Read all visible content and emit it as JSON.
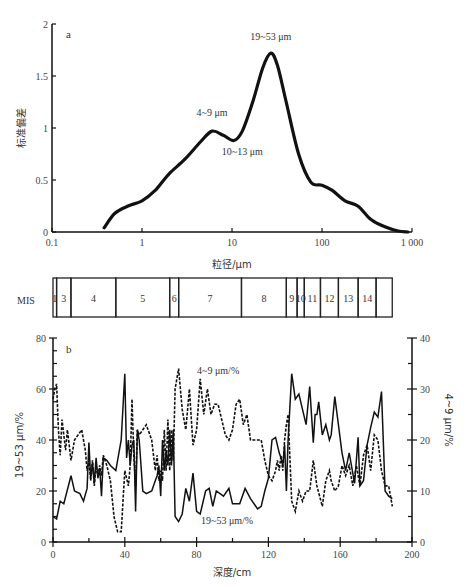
{
  "chart_data": [
    {
      "id": "a",
      "type": "line",
      "panel_label": "a",
      "title": "",
      "xlabel": "粒径/μm",
      "ylabel": "标准偏差",
      "xscale": "log",
      "xlim": [
        0.1,
        1000
      ],
      "ylim": [
        0,
        2
      ],
      "xticks": [
        "0.1",
        "1",
        "10",
        "100",
        "1 000"
      ],
      "yticks": [
        "0",
        "0.5",
        "1",
        "1.5",
        "2"
      ],
      "grid": false,
      "x": [
        0.38,
        0.5,
        0.7,
        1.0,
        1.4,
        2.0,
        3.0,
        4.5,
        6.0,
        8.0,
        10.5,
        13.0,
        17.0,
        22.0,
        27.0,
        32.0,
        40.0,
        55.0,
        75.0,
        100.0,
        130.0,
        180.0,
        250.0,
        350.0,
        500.0,
        700.0,
        900.0
      ],
      "values": [
        0.04,
        0.18,
        0.25,
        0.3,
        0.4,
        0.56,
        0.7,
        0.87,
        0.97,
        0.93,
        0.88,
        0.97,
        1.25,
        1.58,
        1.72,
        1.6,
        1.25,
        0.75,
        0.48,
        0.45,
        0.4,
        0.3,
        0.25,
        0.12,
        0.05,
        0.01,
        0.0
      ],
      "annotations": [
        {
          "text": "19~53 μm",
          "x": 27,
          "y": 1.85
        },
        {
          "text": "4~9 μm",
          "x": 6,
          "y": 1.12
        },
        {
          "text": "10~13 μm",
          "x": 13,
          "y": 0.74
        }
      ]
    },
    {
      "id": "mis",
      "type": "table",
      "label": "MIS",
      "stages": [
        {
          "label": "1",
          "from": 0,
          "to": 2
        },
        {
          "label": "3",
          "from": 2,
          "to": 10
        },
        {
          "label": "4",
          "from": 10,
          "to": 35
        },
        {
          "label": "5",
          "from": 35,
          "to": 65
        },
        {
          "label": "6",
          "from": 65,
          "to": 70
        },
        {
          "label": "7",
          "from": 70,
          "to": 105
        },
        {
          "label": "8",
          "from": 105,
          "to": 130
        },
        {
          "label": "9",
          "from": 130,
          "to": 136
        },
        {
          "label": "10",
          "from": 136,
          "to": 140
        },
        {
          "label": "11",
          "from": 140,
          "to": 149
        },
        {
          "label": "12",
          "from": 149,
          "to": 159
        },
        {
          "label": "13",
          "from": 159,
          "to": 170
        },
        {
          "label": "14",
          "from": 170,
          "to": 180
        },
        {
          "label": "",
          "from": 180,
          "to": 189
        }
      ]
    },
    {
      "id": "b",
      "type": "line",
      "panel_label": "b",
      "xlabel": "深度/cm",
      "ylabel_left": "19~53 μm/%",
      "ylabel_right": "4~9 μm/%",
      "xlim": [
        0,
        200
      ],
      "ylim_left": [
        0,
        80
      ],
      "ylim_right": [
        0,
        40
      ],
      "xticks": [
        "0",
        "40",
        "80",
        "120",
        "160",
        "200"
      ],
      "yticks_left": [
        "0",
        "20",
        "40",
        "60",
        "80"
      ],
      "yticks_right": [
        "0",
        "10",
        "20",
        "30",
        "40"
      ],
      "grid": false,
      "series": [
        {
          "name": "19~53 μm/%",
          "axis": "left",
          "style": "solid",
          "x": [
            0,
            2,
            4,
            6,
            10,
            12,
            15,
            17,
            19,
            20,
            21,
            22,
            23,
            24,
            25,
            26,
            27,
            28,
            30,
            32,
            35,
            38,
            40,
            41,
            42,
            43,
            44,
            45,
            46,
            47,
            48,
            50,
            52,
            55,
            57,
            58,
            59,
            60,
            61,
            62,
            63,
            64,
            65,
            66,
            67,
            68,
            70,
            72,
            74,
            76,
            78,
            80,
            82,
            85,
            87,
            89,
            91,
            95,
            98,
            100,
            104,
            107,
            110,
            114,
            116,
            118,
            120,
            122,
            124,
            125,
            126,
            127,
            128,
            129,
            130,
            131,
            133,
            135,
            137,
            139,
            141,
            143,
            145,
            146,
            147,
            148,
            150,
            152,
            154,
            155,
            157,
            159,
            161,
            163,
            165,
            168,
            170,
            171,
            173,
            175,
            177,
            179,
            181,
            183,
            185,
            187,
            189
          ],
          "values": [
            10,
            9,
            16,
            15,
            26,
            20,
            19,
            16,
            21,
            39,
            25,
            31,
            23,
            33,
            25,
            29,
            18,
            33,
            32,
            30,
            28,
            40,
            66,
            33,
            40,
            30,
            38,
            40,
            12,
            44,
            40,
            20,
            19,
            20,
            24,
            26,
            30,
            18,
            40,
            28,
            36,
            30,
            44,
            30,
            44,
            10,
            8,
            11,
            21,
            16,
            27,
            12,
            11,
            20,
            21,
            14,
            20,
            18,
            21,
            15,
            15,
            21,
            17,
            13,
            14,
            20,
            25,
            40,
            41,
            38,
            35,
            33,
            30,
            38,
            20,
            40,
            66,
            56,
            58,
            52,
            46,
            61,
            39,
            50,
            50,
            55,
            42,
            46,
            40,
            42,
            57,
            46,
            35,
            28,
            35,
            23,
            41,
            22,
            24,
            38,
            45,
            51,
            49,
            59,
            20,
            18,
            17
          ],
          "label_position": {
            "x": 97,
            "y": 7
          }
        },
        {
          "name": "4~9 μm/%",
          "axis": "right",
          "style": "dashed",
          "x": [
            0,
            1,
            2,
            3,
            4,
            5,
            7,
            8,
            10,
            12,
            14,
            16,
            18,
            19,
            20,
            21,
            22,
            23,
            24,
            25,
            26,
            27,
            28,
            30,
            32,
            34,
            36,
            38,
            40,
            42,
            43,
            44,
            45,
            46,
            47,
            48,
            50,
            52,
            55,
            57,
            58,
            59,
            60,
            61,
            62,
            63,
            64,
            65,
            66,
            67,
            68,
            70,
            72,
            74,
            76,
            78,
            80,
            82,
            84,
            86,
            88,
            90,
            92,
            94,
            96,
            98,
            100,
            102,
            104,
            106,
            108,
            110,
            112,
            114,
            116,
            118,
            120,
            122,
            124,
            125,
            126,
            127,
            128,
            129,
            130,
            131,
            133,
            135,
            137,
            139,
            141,
            143,
            145,
            147,
            150,
            152,
            154,
            155,
            157,
            159,
            161,
            163,
            165,
            167,
            169,
            171,
            173,
            175,
            177,
            179,
            181,
            183,
            185,
            187,
            189
          ],
          "values": [
            28,
            30,
            31,
            22,
            17,
            24,
            18,
            22,
            16,
            20,
            21,
            22,
            18,
            14,
            16,
            12,
            16,
            11,
            15,
            13,
            15,
            13,
            17,
            15,
            12,
            5,
            2,
            2,
            14,
            11,
            15,
            28,
            17,
            11,
            22,
            21,
            22,
            23,
            20,
            14,
            17,
            12,
            14,
            12,
            22,
            14,
            24,
            14,
            22,
            16,
            30,
            34,
            26,
            22,
            30,
            19,
            22,
            32,
            25,
            30,
            25,
            27,
            27,
            24,
            21,
            20,
            22,
            27,
            28,
            23,
            25,
            20,
            20,
            20,
            20,
            16,
            13,
            12,
            14,
            16,
            14,
            17,
            14,
            20,
            23,
            25,
            8,
            6,
            10,
            8,
            10,
            10,
            16,
            11,
            7,
            12,
            14,
            12,
            10,
            11,
            15,
            13,
            15,
            11,
            15,
            11,
            17,
            19,
            14,
            21,
            20,
            14,
            11,
            11,
            7,
            6,
            8
          ],
          "label_position": {
            "x": 92,
            "y": 33
          }
        }
      ]
    }
  ]
}
